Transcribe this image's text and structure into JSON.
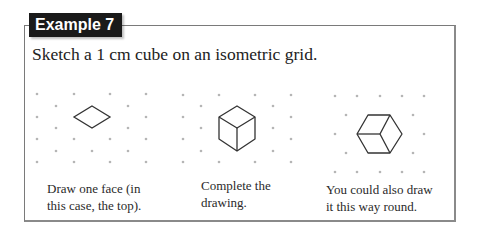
{
  "example": {
    "label": "Example 7",
    "prompt": "Sketch a 1 cm cube on an isometric grid."
  },
  "steps": [
    {
      "caption_line1": "Draw one face (in",
      "caption_line2": "this case, the top).",
      "figure": "rhombus-top-face"
    },
    {
      "caption_line1": "Complete the",
      "caption_line2": "drawing.",
      "figure": "isometric-cube-vertical"
    },
    {
      "caption_line1": "You could also draw",
      "caption_line2": "it this way round.",
      "figure": "isometric-cube-horizontal"
    }
  ],
  "colors": {
    "header_bg": "#1a1a1a",
    "header_text": "#ffffff",
    "border": "#7a7a7a",
    "dot": "#b0b0b0",
    "line": "#333333"
  }
}
